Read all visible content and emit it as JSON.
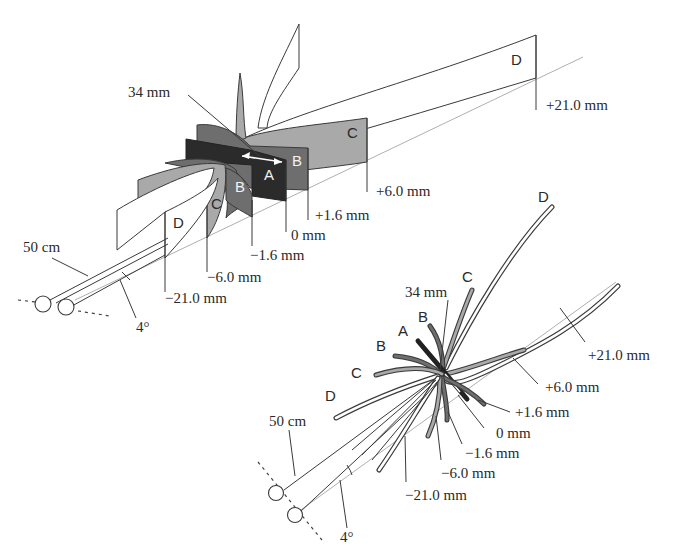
{
  "figure": {
    "colors": {
      "surface_A": "#2b2b2b",
      "surface_B": "#6e6e6e",
      "surface_C": "#a9a9a9",
      "surface_D": "#ffffff",
      "outline": "#3a3a3a",
      "guide_line": "#9a9a9a"
    },
    "top_view": {
      "distance_label": "34 mm",
      "viewing_distance": "50 cm",
      "angle": "4°",
      "surfaces": {
        "A": "A",
        "B_near": "B",
        "B_far": "B",
        "C_near": "C",
        "C_far": "C",
        "D_near": "D",
        "D_far": "D"
      },
      "depths": {
        "neg21": "−21.0 mm",
        "neg6": "−6.0 mm",
        "neg1_6": "−1.6 mm",
        "zero": "0 mm",
        "pos1_6": "+1.6 mm",
        "pos6": "+6.0 mm",
        "pos21": "+21.0 mm"
      }
    },
    "bottom_view": {
      "distance_label": "34 mm",
      "viewing_distance": "50 cm",
      "angle": "4°",
      "surfaces": {
        "A": "A",
        "B_left": "B",
        "B_top": "B",
        "C_left": "C",
        "C_top": "C",
        "D_left": "D",
        "D_top": "D"
      },
      "depths": {
        "neg21": "−21.0 mm",
        "neg6": "−6.0 mm",
        "neg1_6": "−1.6 mm",
        "zero": "0 mm",
        "pos1_6": "+1.6 mm",
        "pos6": "+6.0 mm",
        "pos21": "+21.0 mm"
      }
    }
  }
}
